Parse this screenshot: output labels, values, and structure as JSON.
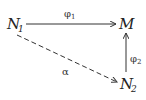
{
  "diagram": {
    "type": "commutative-diagram",
    "nodes": [
      {
        "id": "N1",
        "base": "N",
        "sub": "1"
      },
      {
        "id": "M",
        "base": "M",
        "sub": ""
      },
      {
        "id": "N2",
        "base": "N",
        "sub": "2"
      }
    ],
    "edges": [
      {
        "from": "N1",
        "to": "M",
        "label": "φ",
        "label_sub": "1",
        "style": "solid"
      },
      {
        "from": "N2",
        "to": "M",
        "label": "φ",
        "label_sub": "2",
        "style": "solid"
      },
      {
        "from": "N1",
        "to": "N2",
        "label": "α",
        "label_sub": "",
        "style": "dashed"
      }
    ],
    "colors": {
      "stroke": "#333333",
      "text": "#222222",
      "background": "#ffffff"
    }
  }
}
